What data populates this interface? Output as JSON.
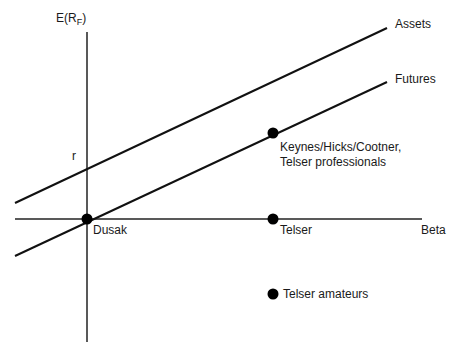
{
  "diagram": {
    "y_axis_label": "E(R",
    "y_axis_label_sub": "F",
    "y_axis_label_close": ")",
    "x_axis_label": "Beta",
    "intercept_label": "r",
    "lines": [
      {
        "name": "Assets",
        "label": "Assets"
      },
      {
        "name": "Futures",
        "label": "Futures"
      }
    ],
    "points": [
      {
        "label": "Dusak"
      },
      {
        "label_line1": "Keynes/Hicks/Cootner,",
        "label_line2": "Telser professionals"
      },
      {
        "label": "Telser"
      },
      {
        "label": "Telser amateurs"
      }
    ],
    "colors": {
      "line": "#111111",
      "point": "#000000"
    }
  }
}
